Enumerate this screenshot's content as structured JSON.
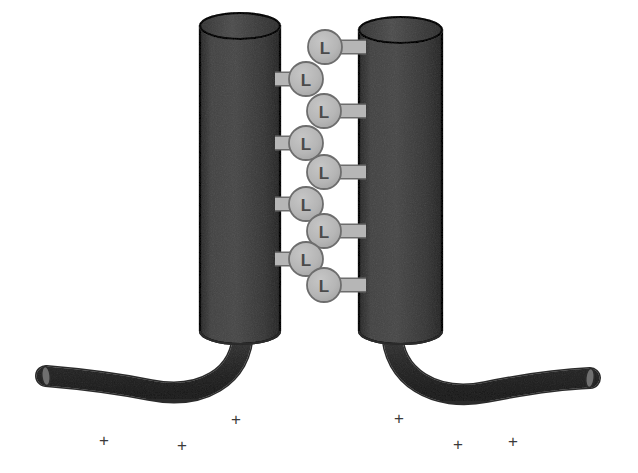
{
  "figure": {
    "background_color": "#ffffff",
    "width": 638,
    "height": 473
  },
  "palette": {
    "cylinder_fill": "#808080",
    "cylinder_fill_dark": "#6e6e6e",
    "cylinder_stroke": "#2b2b2b",
    "cylinder_cap_top": "#8d8d8d",
    "cylinder_cap_bottom": "#7a7a7a",
    "tail_fill": "#6b6b6b",
    "tail_stroke": "#2b2b2b",
    "ligand_fill": "#b8b8b8",
    "ligand_stroke": "#6d6d6d",
    "ligand_text": "#4a4a4a",
    "plus_color": "#3a3a3a"
  },
  "cylinders": [
    {
      "id": "left-cylinder",
      "name": "left-transmembrane-cylinder",
      "x": 200,
      "y": 26,
      "width": 80,
      "height": 305,
      "cap_ry": 13,
      "side": "left"
    },
    {
      "id": "right-cylinder",
      "name": "right-transmembrane-cylinder",
      "x": 359,
      "y": 30,
      "width": 83,
      "height": 301,
      "cap_ry": 13,
      "side": "right"
    }
  ],
  "tails": [
    {
      "id": "left-tail",
      "name": "left-cytoplasmic-tail",
      "path": "M 243 330 C 243 378 200 400 150 390 C 110 382 70 378 46 376",
      "thickness": 19,
      "end_x": 46,
      "end_y": 376,
      "direction": "down-left"
    },
    {
      "id": "right-tail",
      "name": "right-cytoplasmic-tail",
      "path": "M 392 330 C 392 378 436 402 486 392 C 526 384 566 379 590 378",
      "thickness": 19,
      "end_x": 590,
      "end_y": 378,
      "direction": "down-right"
    }
  ],
  "ligands": {
    "label": "L",
    "radius": 17,
    "stem_thickness": 12,
    "items": [
      {
        "label": "L",
        "cy": 47,
        "anchor": "right",
        "cx": 325,
        "stem_to": 366
      },
      {
        "label": "L",
        "cy": 79,
        "anchor": "left",
        "cx": 306,
        "stem_to": 275
      },
      {
        "label": "L",
        "cy": 111,
        "anchor": "right",
        "cx": 324,
        "stem_to": 366
      },
      {
        "label": "L",
        "cy": 143,
        "anchor": "left",
        "cx": 306,
        "stem_to": 275
      },
      {
        "label": "L",
        "cy": 172,
        "anchor": "right",
        "cx": 324,
        "stem_to": 366
      },
      {
        "label": "L",
        "cy": 204,
        "anchor": "left",
        "cx": 306,
        "stem_to": 275
      },
      {
        "label": "L",
        "cy": 231,
        "anchor": "right",
        "cx": 324,
        "stem_to": 366
      },
      {
        "label": "L",
        "cy": 259,
        "anchor": "left",
        "cx": 306,
        "stem_to": 275
      },
      {
        "label": "L",
        "cy": 285,
        "anchor": "right",
        "cx": 324,
        "stem_to": 366
      }
    ]
  },
  "charges": {
    "symbol": "+",
    "items": [
      {
        "symbol": "+",
        "x": 104,
        "y": 442
      },
      {
        "symbol": "+",
        "x": 182,
        "y": 447
      },
      {
        "symbol": "+",
        "x": 236,
        "y": 421
      },
      {
        "symbol": "+",
        "x": 399,
        "y": 420
      },
      {
        "symbol": "+",
        "x": 458,
        "y": 446
      },
      {
        "symbol": "+",
        "x": 513,
        "y": 443
      }
    ]
  }
}
